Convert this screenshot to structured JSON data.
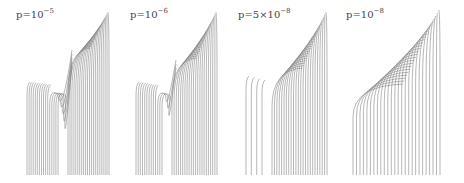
{
  "figure": {
    "panels": [
      {
        "id": "p1",
        "label_base": "p=10",
        "label_exp": "−5",
        "label_x": 16,
        "label_y": 12,
        "left": 27,
        "right": 109,
        "bottom": 175,
        "top": 14,
        "type": "split",
        "inner_count": 16,
        "outer_count": 22,
        "vshape": 5,
        "gap_x": 68,
        "gap_top": 40,
        "notch_y": 88
      },
      {
        "id": "p2",
        "label_base": "p=10",
        "label_exp": "−6",
        "label_x": 130,
        "label_y": 12,
        "left": 136,
        "right": 217,
        "bottom": 175,
        "top": 14,
        "type": "split",
        "inner_count": 13,
        "outer_count": 22,
        "vshape": 3,
        "gap_x": 172,
        "gap_top": 50,
        "notch_y": 88
      },
      {
        "id": "p3",
        "label_base": "p=5×10",
        "label_exp": "−8",
        "label_x": 238,
        "label_y": 12,
        "left": 246,
        "right": 327,
        "bottom": 175,
        "top": 14,
        "type": "gap",
        "inner_count": 4,
        "outer_count": 24,
        "vshape": 0,
        "gap_x": 272,
        "gap_top": 60,
        "notch_y": 82
      },
      {
        "id": "p4",
        "label_base": "p=10",
        "label_exp": "−8",
        "label_x": 346,
        "label_y": 12,
        "left": 353,
        "right": 440,
        "bottom": 175,
        "top": 12,
        "type": "fan",
        "inner_count": 0,
        "outer_count": 26,
        "vshape": 0,
        "gap_x": 0,
        "gap_top": 0,
        "notch_y": 86
      }
    ],
    "line_color": "#7a7a7a"
  }
}
